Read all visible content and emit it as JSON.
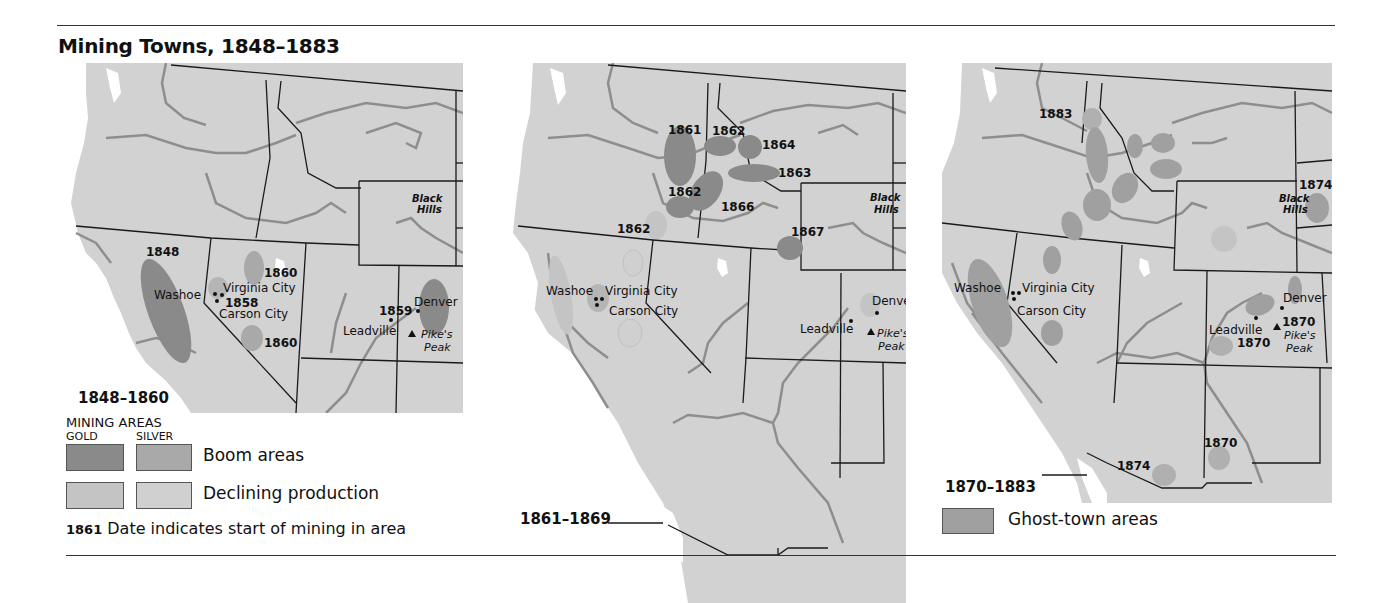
{
  "title": "Mining Towns, 1848–1883",
  "colors": {
    "land": "#d2d2d2",
    "water": "#ffffff",
    "rivers": "#8e8e8e",
    "borders": "#1a1a1a",
    "gold_boom": "#8a8a8a",
    "silver_boom": "#a9a9a9",
    "gold_declining": "#c4c4c4",
    "silver_declining": "#cdcdcd",
    "ghost_town": "#a0a0a0"
  },
  "maps": [
    {
      "period": "1848–1860",
      "places": [
        "Black Hills",
        "Washoe",
        "Virginia City",
        "Carson City",
        "Denver",
        "Leadville",
        "Pike's Peak"
      ],
      "dates": [
        "1848",
        "1860",
        "1858",
        "1860",
        "1859"
      ]
    },
    {
      "period": "1861–1869",
      "places": [
        "Black Hills",
        "Washoe",
        "Virginia City",
        "Carson City",
        "Denver",
        "Leadville",
        "Pike's Peak"
      ],
      "dates": [
        "1861",
        "1862",
        "1864",
        "1863",
        "1862",
        "1866",
        "1862",
        "1867"
      ]
    },
    {
      "period": "1870–1883",
      "places": [
        "Black Hills",
        "Washoe",
        "Virginia City",
        "Carson City",
        "Denver",
        "Leadville",
        "Pike's Peak"
      ],
      "dates": [
        "1883",
        "1874",
        "1870",
        "1870",
        "1870",
        "1874"
      ]
    }
  ],
  "legend": {
    "heading": "MINING AREAS",
    "col_gold": "GOLD",
    "col_silver": "SILVER",
    "boom": "Boom areas",
    "declining": "Declining production",
    "date_example": "1861",
    "date_note": "Date indicates start of mining in area",
    "ghost": "Ghost-town areas"
  },
  "labels": {
    "black": "Black",
    "hills": "Hills",
    "washoe": "Washoe",
    "virginia": "Virginia City",
    "carson": "Carson City",
    "denver": "Denver",
    "leadville": "Leadville",
    "pikes": "Pike's",
    "peak": "Peak"
  }
}
